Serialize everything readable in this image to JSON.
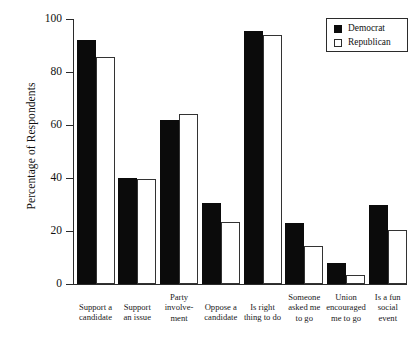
{
  "chart_data": {
    "type": "bar",
    "title": "",
    "subtitle": "",
    "xlabel": "",
    "ylabel": "Percentage of Respondents",
    "ylim": [
      0,
      100
    ],
    "yticks": [
      0,
      20,
      40,
      60,
      80,
      100
    ],
    "grid": false,
    "legend_position": "top-right",
    "categories": [
      "Support a candidate",
      "Support an issue",
      "Party involvement",
      "Oppose a candidate",
      "Is right thing to do",
      "Someone asked me to go",
      "Union encouraged me to go",
      "Is a fun social event"
    ],
    "category_label_lines": [
      [
        "Support a",
        "candidate"
      ],
      [
        "Support",
        "an issue"
      ],
      [
        "Party",
        "involve-",
        "ment"
      ],
      [
        "Oppose a",
        "candidate"
      ],
      [
        "Is right",
        "thing to do"
      ],
      [
        "Someone",
        "asked me",
        "to go"
      ],
      [
        "Union",
        "encouraged",
        "me to go"
      ],
      [
        "Is a fun",
        "social",
        "event"
      ]
    ],
    "series": [
      {
        "name": "Democrat",
        "color": "#0b0b0b",
        "fill": "solid",
        "values": [
          92,
          40,
          62,
          30.5,
          95.5,
          23,
          8,
          30
        ]
      },
      {
        "name": "Republican",
        "color": "#ffffff",
        "fill": "outline",
        "values": [
          85.5,
          39.5,
          64,
          23.5,
          94,
          14.5,
          3.5,
          20.5
        ]
      }
    ]
  },
  "legend": {
    "entries": [
      {
        "label": "Democrat"
      },
      {
        "label": "Republican"
      }
    ]
  },
  "axes": {
    "y_title": "Percentage of Respondents",
    "y_tick_labels": [
      "100",
      "80",
      "60",
      "40",
      "20",
      "0"
    ]
  }
}
